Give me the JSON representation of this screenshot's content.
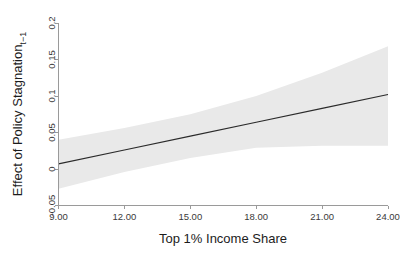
{
  "chart_data": {
    "type": "line",
    "title": "",
    "xlabel": "Top 1% Income Share",
    "ylabel_main": "Effect of Policy Stagnation",
    "ylabel_subscript": "t−1",
    "xlim": [
      9,
      24
    ],
    "ylim": [
      -0.05,
      0.2
    ],
    "xticks": [
      9,
      12,
      15,
      18,
      21,
      24
    ],
    "xtick_labels": [
      "9.00",
      "12.00",
      "15.00",
      "18.00",
      "21.00",
      "24.00"
    ],
    "yticks": [
      -0.05,
      0,
      0.05,
      0.1,
      0.15,
      0.2
    ],
    "ytick_labels": [
      "-0.05",
      "0",
      "0.05",
      "0.1",
      "0.15",
      "0.2"
    ],
    "grid": false,
    "legend": "none",
    "series": [
      {
        "name": "Marginal effect",
        "kind": "line",
        "x": [
          9,
          12,
          15,
          18,
          21,
          24
        ],
        "values": [
          0.007,
          0.026,
          0.045,
          0.064,
          0.083,
          0.102
        ],
        "color": "#2b2b2b"
      },
      {
        "name": "95% confidence interval",
        "kind": "band",
        "x": [
          9,
          12,
          15,
          18,
          21,
          24
        ],
        "lower": [
          -0.027,
          -0.004,
          0.015,
          0.029,
          0.032,
          0.032
        ],
        "upper": [
          0.04,
          0.056,
          0.075,
          0.1,
          0.132,
          0.168
        ],
        "color": "#e9e9e9"
      }
    ]
  },
  "figure": {
    "background_color": "#ffffff",
    "axis_color": "#9a9a9a",
    "tick_label_color": "#3a3a3a",
    "axis_title_color": "#1c1c1c"
  }
}
